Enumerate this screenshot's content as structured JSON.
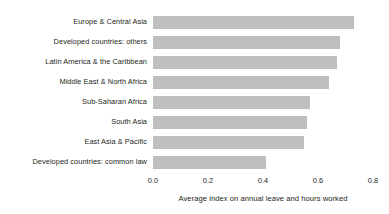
{
  "chart_data": {
    "type": "bar",
    "orientation": "horizontal",
    "title": "",
    "xlabel": "Average index on annual leave and hours worked",
    "ylabel": "",
    "xlim": [
      0.0,
      0.8
    ],
    "xticks": [
      "0.0",
      "0.2",
      "0.4",
      "0.6",
      "0.8"
    ],
    "xtick_values": [
      0.0,
      0.2,
      0.4,
      0.6,
      0.8
    ],
    "grid": false,
    "legend": null,
    "bar_color": "#bfbfbf",
    "text_color": "#231f20",
    "background_color": "#ffffff",
    "categories": [
      "Europe & Central Asia",
      "Developed countries: others",
      "Latin America & the Caribbean",
      "Middle East & North Africa",
      "Sub-Saharan Africa",
      "South Asia",
      "East Asia & Pacific",
      "Developed countries: common law"
    ],
    "values": [
      0.73,
      0.68,
      0.67,
      0.64,
      0.57,
      0.56,
      0.55,
      0.41
    ]
  }
}
